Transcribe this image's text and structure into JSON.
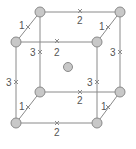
{
  "diagram": {
    "colors": {
      "edge": "#8a8a8a",
      "atom_fill": "#c8c8c8",
      "atom_stroke": "#8a8a8a",
      "label": "#555555"
    },
    "atoms": [
      {
        "id": "back-top-left",
        "x": 40,
        "y": 12
      },
      {
        "id": "back-top-right",
        "x": 120,
        "y": 12
      },
      {
        "id": "front-top-left",
        "x": 16,
        "y": 42
      },
      {
        "id": "front-top-right",
        "x": 97,
        "y": 42
      },
      {
        "id": "back-bottom-left",
        "x": 40,
        "y": 92
      },
      {
        "id": "back-bottom-right",
        "x": 120,
        "y": 92
      },
      {
        "id": "front-bottom-left",
        "x": 16,
        "y": 123
      },
      {
        "id": "front-bottom-right",
        "x": 97,
        "y": 123
      },
      {
        "id": "body-center",
        "x": 68,
        "y": 67
      }
    ],
    "edge_labels": [
      {
        "text": "1",
        "x": 23,
        "y": 28
      },
      {
        "text": "2",
        "x": 78,
        "y": 24
      },
      {
        "text": "1",
        "x": 100,
        "y": 28
      },
      {
        "text": "3",
        "x": 29,
        "y": 55
      },
      {
        "text": "2",
        "x": 53,
        "y": 56
      },
      {
        "text": "3",
        "x": 109,
        "y": 55
      },
      {
        "text": "3",
        "x": 6,
        "y": 84
      },
      {
        "text": "3",
        "x": 85,
        "y": 84
      },
      {
        "text": "2",
        "x": 78,
        "y": 104
      },
      {
        "text": "1",
        "x": 19,
        "y": 109
      },
      {
        "text": "1",
        "x": 100,
        "y": 109
      },
      {
        "text": "2",
        "x": 54,
        "y": 135
      }
    ]
  }
}
